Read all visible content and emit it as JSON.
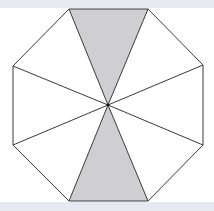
{
  "figure": {
    "total_triangles": 8,
    "shaded_triangles": 2,
    "center": [
      108,
      105
    ],
    "vertices": [
      [
        69,
        9
      ],
      [
        148,
        9
      ],
      [
        203,
        65
      ],
      [
        203,
        145
      ],
      [
        148,
        201
      ],
      [
        69,
        201
      ],
      [
        13,
        145
      ],
      [
        13,
        66
      ]
    ],
    "shaded": [
      [
        [
          69,
          9
        ],
        [
          148,
          9
        ]
      ],
      [
        [
          148,
          201
        ],
        [
          69,
          201
        ]
      ]
    ]
  },
  "colors": {
    "background": "#ffffff",
    "strip": "#e6e9ef",
    "shade": "#cfcfd3",
    "line": "#3a3a3a"
  }
}
